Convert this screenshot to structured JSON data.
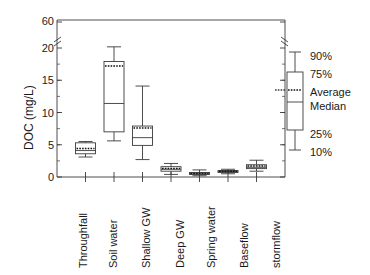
{
  "chart_data": {
    "type": "box",
    "title": "",
    "xlabel": "",
    "ylabel": "DOC (mg/L)",
    "ylim": [
      0,
      60
    ],
    "y_ticks": [
      0,
      5,
      10,
      15,
      20,
      60
    ],
    "y_tick_labels": [
      "0",
      "5",
      "10",
      "15",
      "20",
      "60"
    ],
    "y_axis_break": true,
    "y_break_between": [
      20,
      60
    ],
    "grid": false,
    "legend_position": "right-outside",
    "categories": [
      "Throughfall",
      "Soil water",
      "Shallow GW",
      "Deep GW",
      "Spring water",
      "Baseflow",
      "stormflow"
    ],
    "stats_keys": [
      "p10",
      "p25",
      "median",
      "average",
      "p75",
      "p90"
    ],
    "boxes": [
      {
        "category": "Throughfall",
        "p10": 3.1,
        "p25": 3.6,
        "median": 4.1,
        "average": 4.4,
        "p75": 5.3,
        "p90": 5.5
      },
      {
        "category": "Soil water",
        "p10": 5.6,
        "p25": 7.0,
        "median": 11.4,
        "average": 17.2,
        "p75": 17.9,
        "p90": 21.8
      },
      {
        "category": "Shallow GW",
        "p10": 2.7,
        "p25": 4.9,
        "median": 6.1,
        "average": 7.6,
        "p75": 7.9,
        "p90": 14.1
      },
      {
        "category": "Deep GW",
        "p10": 0.4,
        "p25": 0.9,
        "median": 1.2,
        "average": 1.3,
        "p75": 1.6,
        "p90": 2.1
      },
      {
        "category": "Spring water",
        "p10": 0.2,
        "p25": 0.4,
        "median": 0.5,
        "average": 0.55,
        "p75": 0.7,
        "p90": 1.1
      },
      {
        "category": "Baseflow",
        "p10": 0.5,
        "p25": 0.7,
        "median": 0.85,
        "average": 0.9,
        "p75": 1.0,
        "p90": 1.2
      },
      {
        "category": "stormflow",
        "p10": 0.9,
        "p25": 1.3,
        "median": 1.5,
        "average": 1.7,
        "p75": 1.9,
        "p90": 2.6
      }
    ]
  },
  "legend": {
    "items": [
      {
        "key": "p90",
        "label": "90%"
      },
      {
        "key": "p75",
        "label": "75%"
      },
      {
        "key": "average",
        "label": "Average"
      },
      {
        "key": "median",
        "label": "Median"
      },
      {
        "key": "p25",
        "label": "25%"
      },
      {
        "key": "p10",
        "label": "10%"
      }
    ]
  },
  "style": {
    "line_color": "#3a3a3a",
    "box_fill": "#ffffff",
    "average_line_color": "#111111",
    "text_color": "#1a1a1a"
  }
}
